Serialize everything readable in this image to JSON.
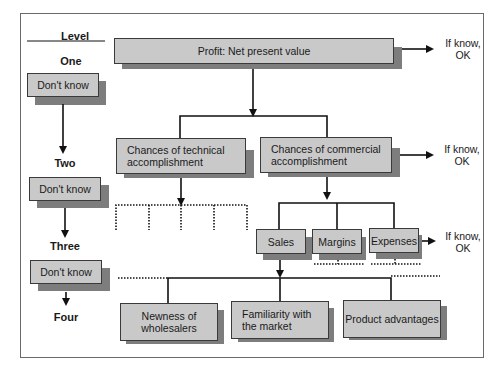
{
  "levels": {
    "header": "Level",
    "one": "One",
    "two": "Two",
    "three": "Three",
    "four": "Four"
  },
  "dont_know": {
    "one": "Don't know",
    "two": "Don't know",
    "three": "Don't know"
  },
  "nodes": {
    "profit": "Profit: Net present value",
    "technical": "Chances of technical accomplishment",
    "commercial": "Chances of commercial accomplishment",
    "sales": "Sales",
    "margins": "Margins",
    "expenses": "Expenses",
    "newness": "Newness of wholesalers",
    "familiarity": "Familiarity with the market",
    "product": "Product advantages"
  },
  "if_know": {
    "one": "If know, OK",
    "two": "If know, OK",
    "three": "If know, OK"
  },
  "colors": {
    "box_fill": "#c9c9c9",
    "box_shadow": "#7d7d7d",
    "line": "#111111"
  }
}
